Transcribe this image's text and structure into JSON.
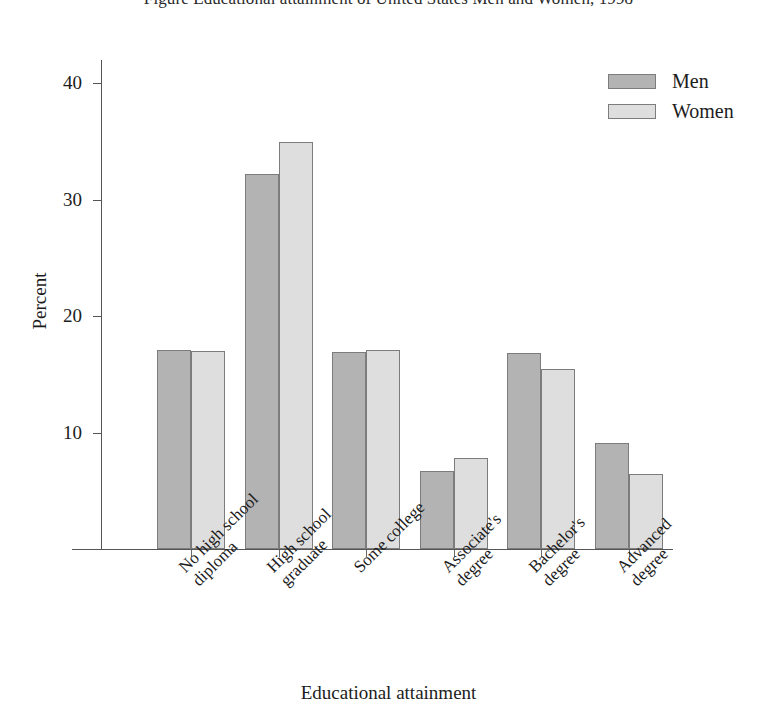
{
  "chart_data": {
    "type": "bar",
    "title": "Figure  Educational attainment of United States Men and Women, 1998",
    "xlabel": "Educational attainment",
    "ylabel": "Percent",
    "categories": [
      "No high school\ndiploma",
      "High school\ngraduate",
      "Some college",
      "Associate's\ndegree",
      "Bachelor's\ndegree",
      "Advanced\ndegree"
    ],
    "series": [
      {
        "name": "Men",
        "color": "#b3b3b3",
        "values": [
          17.1,
          32.2,
          16.9,
          6.7,
          16.8,
          9.1
        ]
      },
      {
        "name": "Women",
        "color": "#dedede",
        "values": [
          17.0,
          35.0,
          17.1,
          7.8,
          15.5,
          6.4
        ]
      }
    ],
    "ylim": [
      0,
      42
    ],
    "yticks": [
      10,
      20,
      30,
      40
    ],
    "ytick_labels": [
      "10",
      "20",
      "30",
      "40"
    ],
    "grid": false,
    "legend_position": "top-right"
  },
  "legend": {
    "items": [
      {
        "label": "Men"
      },
      {
        "label": "Women"
      }
    ]
  },
  "axis": {
    "y_title": "Percent",
    "x_title": "Educational attainment"
  }
}
